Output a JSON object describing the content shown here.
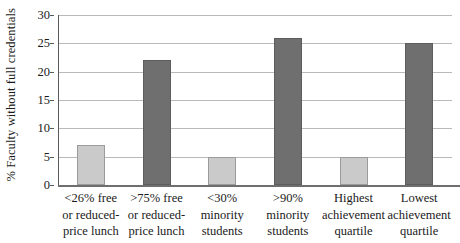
{
  "chart_data": {
    "type": "bar",
    "title": "",
    "xlabel": "",
    "ylabel": "% Faculty without full credentials",
    "ylim": [
      0,
      30
    ],
    "ytick_step": 5,
    "yticks": [
      0,
      5,
      10,
      15,
      20,
      25,
      30
    ],
    "ytick_labels": [
      "0",
      "5",
      "10",
      "15",
      "20",
      "25",
      "30"
    ],
    "grid": true,
    "legend": "none",
    "categories": [
      "<26% free or reduced-price lunch",
      ">75% free or reduced-price lunch",
      "<30% minority students",
      ">90% minority students",
      "Highest achievement quartile",
      "Lowest achievement quartile"
    ],
    "category_lines": [
      [
        "<26% free",
        "or reduced-",
        "price lunch"
      ],
      [
        ">75% free",
        "or reduced-",
        "price lunch"
      ],
      [
        "<30%",
        "minority",
        "students"
      ],
      [
        ">90%",
        "minority",
        "students"
      ],
      [
        "Highest",
        "achievement",
        "quartile"
      ],
      [
        "Lowest",
        "achievement",
        "quartile"
      ]
    ],
    "values": [
      7,
      22,
      5,
      26,
      5,
      25
    ],
    "bar_styles": [
      "light",
      "dark",
      "light",
      "dark",
      "light",
      "dark"
    ],
    "colors": {
      "light_bar": "#cacaca",
      "light_bar_border": "#9b9b9b",
      "dark_bar": "#6f6f6f",
      "dark_bar_border": "#5d5d5d",
      "gridline": "#b9b9ba",
      "axis": "#59595a",
      "text": "#1a1a1a",
      "background": "#ffffff"
    }
  }
}
